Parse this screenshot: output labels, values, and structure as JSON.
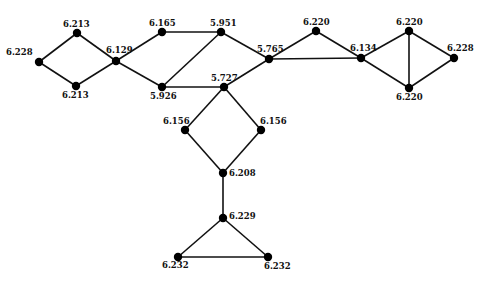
{
  "diagram": {
    "type": "graph",
    "node_color": "#000000",
    "edge_color": "#111111",
    "nodes": [
      {
        "id": "n1",
        "label": "6.228",
        "x": 39,
        "y": 62,
        "lx": 6,
        "ly": 55,
        "anchor": "start"
      },
      {
        "id": "n2",
        "label": "6.213",
        "x": 77,
        "y": 33,
        "lx": 63,
        "ly": 27,
        "anchor": "start"
      },
      {
        "id": "n3",
        "label": "6.213",
        "x": 76,
        "y": 86,
        "lx": 62,
        "ly": 98,
        "anchor": "start"
      },
      {
        "id": "n4",
        "label": "6.129",
        "x": 116,
        "y": 61,
        "lx": 106,
        "ly": 53,
        "anchor": "start"
      },
      {
        "id": "n5",
        "label": "6.165",
        "x": 162,
        "y": 32,
        "lx": 149,
        "ly": 26,
        "anchor": "start"
      },
      {
        "id": "n6",
        "label": "5.951",
        "x": 221,
        "y": 32,
        "lx": 210,
        "ly": 26,
        "anchor": "start"
      },
      {
        "id": "n7",
        "label": "5.926",
        "x": 162,
        "y": 87,
        "lx": 150,
        "ly": 99,
        "anchor": "start"
      },
      {
        "id": "n8",
        "label": "5.727",
        "x": 224,
        "y": 87,
        "lx": 211,
        "ly": 81,
        "anchor": "start"
      },
      {
        "id": "n9",
        "label": "5.765",
        "x": 269,
        "y": 59,
        "lx": 257,
        "ly": 52,
        "anchor": "start"
      },
      {
        "id": "n10",
        "label": "6.220",
        "x": 316,
        "y": 31,
        "lx": 303,
        "ly": 25,
        "anchor": "start"
      },
      {
        "id": "n11",
        "label": "6.134",
        "x": 361,
        "y": 58,
        "lx": 350,
        "ly": 51,
        "anchor": "start"
      },
      {
        "id": "n12",
        "label": "6.220",
        "x": 409,
        "y": 31,
        "lx": 396,
        "ly": 25,
        "anchor": "start"
      },
      {
        "id": "n13",
        "label": "6.228",
        "x": 454,
        "y": 58,
        "lx": 447,
        "ly": 51,
        "anchor": "start"
      },
      {
        "id": "n14",
        "label": "6.220",
        "x": 409,
        "y": 88,
        "lx": 396,
        "ly": 100,
        "anchor": "start"
      },
      {
        "id": "n15",
        "label": "6.156",
        "x": 185,
        "y": 130,
        "lx": 163,
        "ly": 124,
        "anchor": "start"
      },
      {
        "id": "n16",
        "label": "6.156",
        "x": 261,
        "y": 130,
        "lx": 260,
        "ly": 124,
        "anchor": "start"
      },
      {
        "id": "n17",
        "label": "6.208",
        "x": 223,
        "y": 173,
        "lx": 229,
        "ly": 176,
        "anchor": "start"
      },
      {
        "id": "n18",
        "label": "6.229",
        "x": 223,
        "y": 218,
        "lx": 229,
        "ly": 219,
        "anchor": "start"
      },
      {
        "id": "n19",
        "label": "6.232",
        "x": 178,
        "y": 257,
        "lx": 162,
        "ly": 268,
        "anchor": "start"
      },
      {
        "id": "n20",
        "label": "6.232",
        "x": 268,
        "y": 257,
        "lx": 264,
        "ly": 269,
        "anchor": "start"
      }
    ],
    "edges": [
      [
        "n1",
        "n2"
      ],
      [
        "n1",
        "n3"
      ],
      [
        "n2",
        "n4"
      ],
      [
        "n3",
        "n4"
      ],
      [
        "n4",
        "n5"
      ],
      [
        "n4",
        "n7"
      ],
      [
        "n5",
        "n6"
      ],
      [
        "n6",
        "n7"
      ],
      [
        "n6",
        "n9"
      ],
      [
        "n7",
        "n8"
      ],
      [
        "n8",
        "n9"
      ],
      [
        "n9",
        "n10"
      ],
      [
        "n9",
        "n11"
      ],
      [
        "n10",
        "n11"
      ],
      [
        "n11",
        "n12"
      ],
      [
        "n11",
        "n14"
      ],
      [
        "n12",
        "n14"
      ],
      [
        "n12",
        "n13"
      ],
      [
        "n14",
        "n13"
      ],
      [
        "n8",
        "n15"
      ],
      [
        "n8",
        "n16"
      ],
      [
        "n15",
        "n17"
      ],
      [
        "n16",
        "n17"
      ],
      [
        "n17",
        "n18"
      ],
      [
        "n18",
        "n19"
      ],
      [
        "n18",
        "n20"
      ],
      [
        "n19",
        "n20"
      ]
    ]
  }
}
